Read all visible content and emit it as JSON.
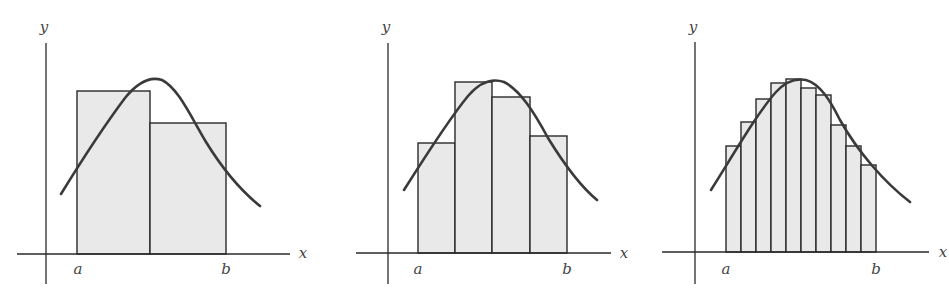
{
  "figure": {
    "fill_color": "#e9e9e9",
    "stroke_color": "#2a2a2a",
    "curve_color": "#3a3a3a"
  },
  "panels": [
    {
      "id": "panel-1",
      "n_rectangles": 2,
      "labels": {
        "x": "x",
        "y": "y",
        "a": "a",
        "b": "b"
      },
      "axes": {
        "origin": [
          46,
          254
        ],
        "x_start": 17,
        "x_end": 290,
        "y_top": 43,
        "y_bottom": 284
      },
      "label_pos": {
        "y": [
          44,
          32
        ],
        "x": [
          303,
          258
        ],
        "a": [
          78,
          274
        ],
        "b": [
          226,
          274
        ]
      },
      "rects": [
        {
          "x0": 77,
          "x1": 150,
          "top": 91
        },
        {
          "x0": 150,
          "x1": 226,
          "top": 123
        }
      ],
      "curve": "M61,194 C85,155 110,118 125,98 C138,82 150,76 162,80 C178,88 190,115 206,142 C222,168 240,190 260,206"
    },
    {
      "id": "panel-2",
      "n_rectangles": 4,
      "labels": {
        "x": "x",
        "y": "y",
        "a": "a",
        "b": "b"
      },
      "axes": {
        "origin": [
          388,
          253
        ],
        "x_start": 356,
        "x_end": 611,
        "y_top": 43,
        "y_bottom": 284
      },
      "label_pos": {
        "y": [
          386,
          32
        ],
        "x": [
          624,
          258
        ],
        "a": [
          418,
          274
        ],
        "b": [
          567,
          274
        ]
      },
      "rects": [
        {
          "x0": 418,
          "x1": 455,
          "top": 143
        },
        {
          "x0": 455,
          "x1": 492,
          "top": 82
        },
        {
          "x0": 492,
          "x1": 530,
          "top": 97
        },
        {
          "x0": 530,
          "x1": 567,
          "top": 136
        }
      ],
      "curve": "M404,190 C428,152 450,118 468,96 C480,82 492,78 504,82 C520,90 534,112 548,138 C564,164 580,186 597,200"
    },
    {
      "id": "panel-3",
      "n_rectangles": 10,
      "labels": {
        "x": "x",
        "y": "y",
        "a": "a",
        "b": "b"
      },
      "axes": {
        "origin": [
          695,
          252
        ],
        "x_start": 662,
        "x_end": 929,
        "y_top": 42,
        "y_bottom": 284
      },
      "label_pos": {
        "y": [
          693,
          32
        ],
        "x": [
          943,
          257
        ],
        "a": [
          726,
          274
        ],
        "b": [
          876,
          274
        ]
      },
      "rects": [
        {
          "x0": 726,
          "x1": 741,
          "top": 146
        },
        {
          "x0": 741,
          "x1": 756,
          "top": 122
        },
        {
          "x0": 756,
          "x1": 771,
          "top": 99
        },
        {
          "x0": 771,
          "x1": 786,
          "top": 83
        },
        {
          "x0": 786,
          "x1": 801,
          "top": 79
        },
        {
          "x0": 801,
          "x1": 816,
          "top": 88
        },
        {
          "x0": 816,
          "x1": 831,
          "top": 95
        },
        {
          "x0": 831,
          "x1": 846,
          "top": 125
        },
        {
          "x0": 846,
          "x1": 861,
          "top": 146
        },
        {
          "x0": 861,
          "x1": 876,
          "top": 165
        }
      ],
      "curve": "M711,190 C735,152 758,112 776,92 C786,81 796,78 806,80 C820,84 830,100 840,120 C858,152 884,182 910,202"
    }
  ]
}
